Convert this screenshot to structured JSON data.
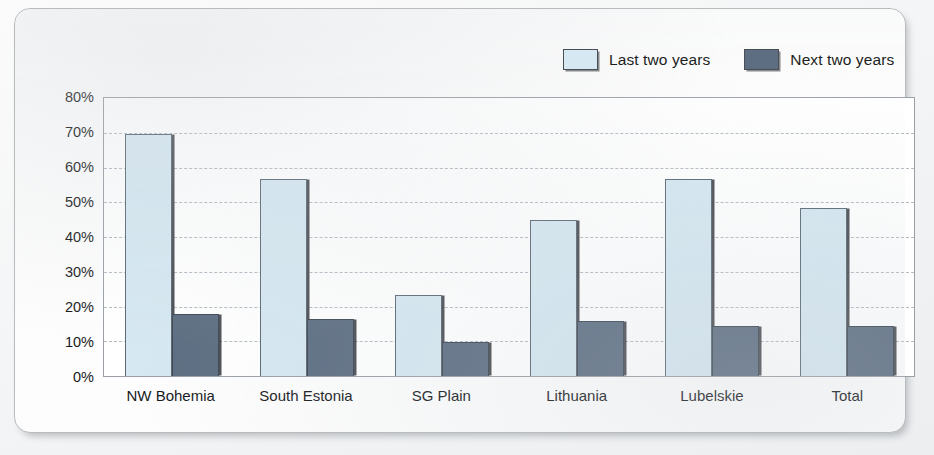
{
  "chart_data": {
    "type": "bar",
    "title": "",
    "xlabel": "",
    "ylabel": "",
    "categories": [
      "NW Bohemia",
      "South Estonia",
      "SG Plain",
      "Lithuania",
      "Lubelskie",
      "Total"
    ],
    "series": [
      {
        "name": "Last two years",
        "color": "#d6e8f2",
        "values": [
          69.5,
          56.5,
          23,
          44.5,
          56.5,
          48
        ]
      },
      {
        "name": "Next two years",
        "color": "#5d6e82",
        "values": [
          17.5,
          16,
          9.5,
          15.5,
          14,
          14
        ]
      }
    ],
    "ylim": [
      0,
      80
    ],
    "ytick_step": 10,
    "ytick_labels": [
      "80%",
      "70%",
      "60%",
      "50%",
      "40%",
      "30%",
      "20%",
      "10%",
      "0%"
    ],
    "ytick_values": [
      80,
      70,
      60,
      50,
      40,
      30,
      20,
      10,
      0
    ],
    "value_suffix": "%",
    "grid": true,
    "grid_style": "dashed-horizontal",
    "legend_position": "top-right"
  },
  "legend": {
    "entries": [
      {
        "label": "Last two years",
        "swatch": "light-blue-swatch"
      },
      {
        "label": "Next two years",
        "swatch": "dark-slate-swatch"
      }
    ]
  },
  "colors": {
    "series_light": "#d6e8f2",
    "series_dark": "#5d6e82",
    "plot_border": "#9aa0a6",
    "gridline": "#b6bcc4",
    "text": "#17191c",
    "card_background": "#fdfdfd",
    "page_background": "#f4f5f6"
  }
}
